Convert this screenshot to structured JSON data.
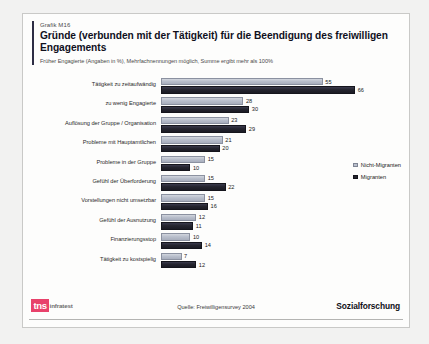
{
  "header": {
    "kicker": "Grafik M16",
    "title": "Gründe (verbunden mit der Tätigkeit) für die Beendigung des freiwilligen Engagements",
    "subtitle": "Früher Engagierte (Angaben in %), Mehrfachnennungen möglich, Summe ergibt mehr als 100%"
  },
  "legend": {
    "items": [
      {
        "label": "Nicht-Migranten",
        "color": "#b9bfcc"
      },
      {
        "label": "Migranten",
        "color": "#23232e"
      }
    ]
  },
  "footer": {
    "logo_mark": "tns",
    "logo_word": "infratest",
    "source": "Quelle: Freiwilligensurvey 2004",
    "department": "Sozialforschung"
  },
  "chart_data": {
    "type": "bar",
    "orientation": "horizontal",
    "title": "Gründe (verbunden mit der Tätigkeit) für die Beendigung des freiwilligen Engagements",
    "subtitle": "Früher Engagierte (Angaben in %), Mehrfachnennungen möglich, Summe ergibt mehr als 100%",
    "xlabel": "",
    "ylabel": "",
    "xlim": [
      0,
      70
    ],
    "grid": false,
    "legend_position": "right",
    "categories": [
      "Tätigkeit zu zeitaufwändig",
      "zu wenig Engagierte",
      "Auflösung der Gruppe / Organisation",
      "Probleme mit Hauptamtlichen",
      "Probleme in der Gruppe",
      "Gefühl der Überforderung",
      "Vorstellungen nicht umsetzbar",
      "Gefühl der Ausnutzung",
      "Finanzierungsstop",
      "Tätigkeit zu kostspielig"
    ],
    "series": [
      {
        "name": "Nicht-Migranten",
        "color": "#b9bfcc",
        "values": [
          55,
          28,
          23,
          21,
          15,
          15,
          15,
          12,
          10,
          7
        ]
      },
      {
        "name": "Migranten",
        "color": "#23232e",
        "values": [
          66,
          30,
          29,
          20,
          10,
          22,
          16,
          11,
          14,
          12
        ]
      }
    ],
    "units": "%",
    "source": "Quelle: Freiwilligensurvey 2004"
  }
}
